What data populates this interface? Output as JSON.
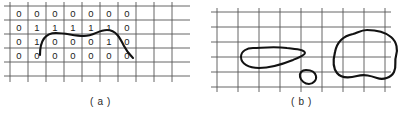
{
  "figure": {
    "background_color": "#ffffff",
    "ink_color": "#1a1a1a",
    "grid_color": "#555555"
  },
  "panels": [
    {
      "id": "a",
      "caption": "( a )",
      "description": "binary-grid-with-open-curve",
      "grid": {
        "columns": 9,
        "rows": 6,
        "cell_width": 18,
        "cell_height": 14,
        "origin_x": 10,
        "origin_y": 6,
        "line_color": "#555555"
      },
      "digit_rows": [
        [
          "0",
          "0",
          "0",
          "0",
          "0",
          "0",
          "0"
        ],
        [
          "0",
          "1",
          "1",
          "1",
          "1",
          "1",
          "0"
        ],
        [
          "0",
          "1",
          "0",
          "0",
          "0",
          "1",
          "0"
        ],
        [
          "0",
          "0",
          "0",
          "0",
          "0",
          "0",
          "0"
        ]
      ],
      "curve": {
        "type": "open-arc",
        "stroke_width": 2.1,
        "path": "M 40 55 C 40 40, 46 33, 56 33 C 66 33, 74 36, 84 36 C 94 36, 98 30, 107 30 C 116 30, 120 38, 124 46 C 127 52, 130 55, 133 58"
      }
    },
    {
      "id": "b",
      "caption": "( b )",
      "description": "grid-with-three-closed-blobs",
      "grid": {
        "columns": 8,
        "rows": 5,
        "cell_width": 21,
        "cell_height": 15,
        "origin_x": 16,
        "origin_y": 12,
        "line_color": "#555555"
      },
      "blobs": [
        {
          "name": "teardrop-blob",
          "stroke_width": 2.0,
          "path": "M 52 48 C 46 48, 40 51, 40 57 C 40 64, 48 68, 58 68 C 70 68, 82 64, 92 60 C 99 57, 104 55, 104 53 C 104 50, 96 49, 86 48 C 72 46, 60 48, 52 48 Z"
        },
        {
          "name": "small-blob",
          "stroke_width": 2.0,
          "path": "M 105 70 C 101 70, 98 73, 99 77 C 100 81, 104 84, 108 84 C 112 84, 116 80, 115 76 C 114 72, 110 70, 105 70 Z"
        },
        {
          "name": "large-blob",
          "stroke_width": 2.2,
          "path": "M 152 34 C 142 36, 136 42, 134 52 C 132 60, 132 68, 136 73 C 140 78, 148 78, 156 76 C 164 74, 170 76, 176 78 C 182 80, 190 78, 193 72 C 196 66, 193 62, 195 56 C 197 50, 196 42, 190 37 C 184 32, 174 30, 166 30 C 160 30, 156 33, 152 34 Z"
        }
      ]
    }
  ]
}
